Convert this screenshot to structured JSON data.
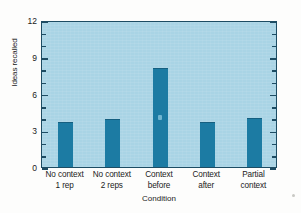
{
  "chart_data": {
    "type": "bar",
    "title": "",
    "xlabel": "Condition",
    "ylabel": "Ideas recalled",
    "categories": [
      "No context 1 rep",
      "No context 2 reps",
      "Context before",
      "Context after",
      "Partial context"
    ],
    "category_lines": [
      [
        "No context",
        "1 rep"
      ],
      [
        "No context",
        "2 reps"
      ],
      [
        "Context",
        "before"
      ],
      [
        "Context",
        "after"
      ],
      [
        "Partial",
        "context"
      ]
    ],
    "values": [
      3.7,
      3.9,
      8.1,
      3.7,
      4.0
    ],
    "ylim": [
      0,
      12
    ],
    "yticks": [
      0,
      3,
      6,
      9,
      12
    ],
    "ytick_labels": [
      "0",
      "3",
      "6",
      "9",
      "12"
    ],
    "yminor_step": 1,
    "grid": false,
    "legend": null,
    "bar_color": "#1c7ba3",
    "plot_background": "#a9d4e5",
    "axis_color": "#1d4c63"
  },
  "figure": {
    "background": "#fdfdfc"
  }
}
